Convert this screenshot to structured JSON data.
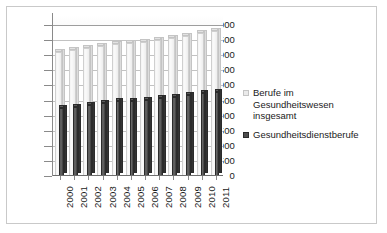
{
  "chart_data": {
    "type": "bar",
    "title": "",
    "subtitle": "",
    "xlabel": "",
    "ylabel": "",
    "categories": [
      "2000",
      "2001",
      "2002",
      "2003",
      "2004",
      "2005",
      "2006",
      "2007",
      "2008",
      "2009",
      "2010",
      "2011"
    ],
    "series": [
      {
        "name": "Berufe im Gesundheitswesen insgesamt",
        "color": "#eaeaea",
        "values": [
          4100,
          4180,
          4250,
          4320,
          4380,
          4420,
          4450,
          4500,
          4580,
          4650,
          4730,
          4800
        ]
      },
      {
        "name": "Gesundheitsdienstberufe",
        "color": "#4f4f4f",
        "values": [
          2250,
          2300,
          2350,
          2420,
          2470,
          2500,
          2530,
          2580,
          2620,
          2680,
          2740,
          2790
        ]
      }
    ],
    "ylim": [
      0,
      5000
    ],
    "ytick_step": 500,
    "ytick_labels": [
      "5.000",
      "4.500",
      "4.000",
      "3.500",
      "3.000",
      "2.500",
      "2.000",
      "1.500",
      "1.000",
      "500",
      "0"
    ],
    "ytick_values": [
      5000,
      4500,
      4000,
      3500,
      3000,
      2500,
      2000,
      1500,
      1000,
      500,
      0
    ],
    "grid": true,
    "grid_axis": "y",
    "legend_position": "right",
    "legend": [
      {
        "label": "Berufe im Gesundheitswesen insgesamt",
        "marker": "square-light"
      },
      {
        "label": "Gesundheitsdienstberufe",
        "marker": "square-dark"
      }
    ],
    "xtick_rotation": 90
  }
}
